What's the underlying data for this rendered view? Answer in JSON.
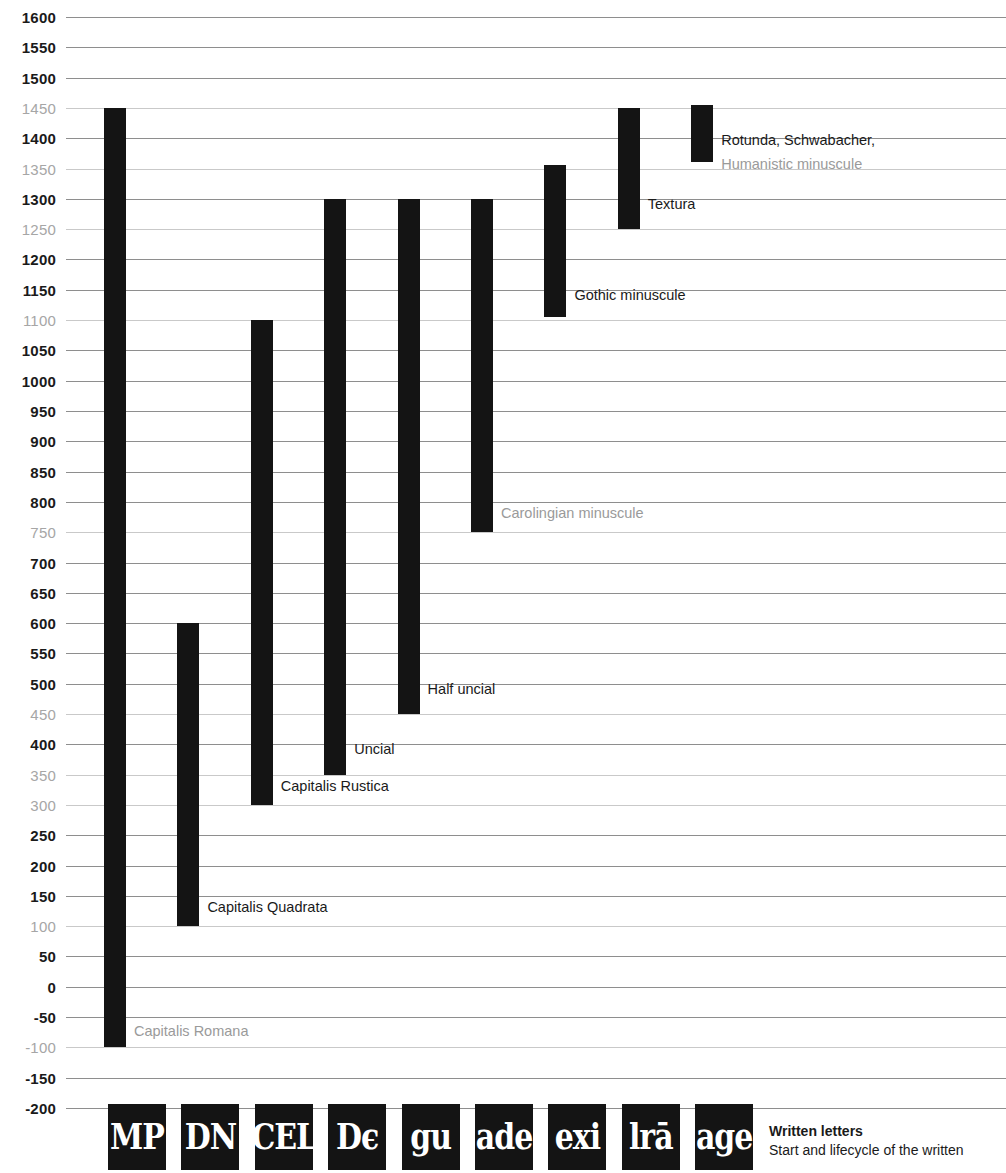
{
  "chart_data": {
    "type": "bar",
    "orientation": "vertical-range",
    "title": "Written letters",
    "subtitle": "Start and lifecycle of the written",
    "xlabel": "",
    "ylabel": "",
    "ylim": [
      -200,
      1600
    ],
    "tick_step": 50,
    "grid": true,
    "legend": "none",
    "y_ticks": [
      {
        "value": 1600,
        "label": "1600",
        "muted": false
      },
      {
        "value": 1550,
        "label": "1550",
        "muted": false
      },
      {
        "value": 1500,
        "label": "1500",
        "muted": false
      },
      {
        "value": 1450,
        "label": "1450",
        "muted": true
      },
      {
        "value": 1400,
        "label": "1400",
        "muted": false
      },
      {
        "value": 1350,
        "label": "1350",
        "muted": true
      },
      {
        "value": 1300,
        "label": "1300",
        "muted": false
      },
      {
        "value": 1250,
        "label": "1250",
        "muted": true
      },
      {
        "value": 1200,
        "label": "1200",
        "muted": false
      },
      {
        "value": 1150,
        "label": "1150",
        "muted": false
      },
      {
        "value": 1100,
        "label": "1100",
        "muted": true
      },
      {
        "value": 1050,
        "label": "1050",
        "muted": false
      },
      {
        "value": 1000,
        "label": "1000",
        "muted": false
      },
      {
        "value": 950,
        "label": "950",
        "muted": false
      },
      {
        "value": 900,
        "label": "900",
        "muted": false
      },
      {
        "value": 850,
        "label": "850",
        "muted": false
      },
      {
        "value": 800,
        "label": "800",
        "muted": false
      },
      {
        "value": 750,
        "label": "750",
        "muted": true
      },
      {
        "value": 700,
        "label": "700",
        "muted": false
      },
      {
        "value": 650,
        "label": "650",
        "muted": false
      },
      {
        "value": 600,
        "label": "600",
        "muted": false
      },
      {
        "value": 550,
        "label": "550",
        "muted": false
      },
      {
        "value": 500,
        "label": "500",
        "muted": false
      },
      {
        "value": 450,
        "label": "450",
        "muted": true
      },
      {
        "value": 400,
        "label": "400",
        "muted": false
      },
      {
        "value": 350,
        "label": "350",
        "muted": true
      },
      {
        "value": 300,
        "label": "300",
        "muted": true
      },
      {
        "value": 250,
        "label": "250",
        "muted": false
      },
      {
        "value": 200,
        "label": "200",
        "muted": false
      },
      {
        "value": 150,
        "label": "150",
        "muted": false
      },
      {
        "value": 100,
        "label": "100",
        "muted": true
      },
      {
        "value": 50,
        "label": "50",
        "muted": false
      },
      {
        "value": 0,
        "label": "0",
        "muted": false
      },
      {
        "value": -50,
        "label": "-50",
        "muted": false
      },
      {
        "value": -100,
        "label": "-100",
        "muted": true
      },
      {
        "value": -150,
        "label": "-150",
        "muted": false
      },
      {
        "value": -200,
        "label": "-200",
        "muted": false
      }
    ],
    "categories": [
      "Capitalis Romana",
      "Capitalis Quadrata",
      "Capitalis Rustica",
      "Uncial",
      "Half uncial",
      "Carolingian minuscule",
      "Gothic minuscule",
      "Textura",
      "Rotunda, Schwabacher, Humanistic minuscule"
    ],
    "bars": [
      {
        "label": "Capitalis Romana",
        "start": -100,
        "end": 1450,
        "label_muted": true,
        "label_at": -75
      },
      {
        "label": "Capitalis Quadrata",
        "start": 100,
        "end": 600,
        "label_muted": false,
        "label_at": 130
      },
      {
        "label": "Capitalis Rustica",
        "start": 300,
        "end": 1100,
        "label_muted": false,
        "label_at": 330
      },
      {
        "label": "Uncial",
        "start": 350,
        "end": 1300,
        "label_muted": false,
        "label_at": 390
      },
      {
        "label": "Half uncial",
        "start": 450,
        "end": 1300,
        "label_muted": false,
        "label_at": 490
      },
      {
        "label": "Carolingian minuscule",
        "start": 750,
        "end": 1300,
        "label_muted": true,
        "label_at": 780
      },
      {
        "label": "Gothic minuscule",
        "start": 1105,
        "end": 1355,
        "label_muted": false,
        "label_at": 1140
      },
      {
        "label": "Textura",
        "start": 1250,
        "end": 1450,
        "label_muted": false,
        "label_at": 1290
      },
      {
        "label": "Rotunda, Schwabacher,",
        "start": 1360,
        "end": 1455,
        "label_muted": false,
        "label_at": 1395
      },
      {
        "label": "Humanistic minuscule",
        "start": null,
        "end": null,
        "label_muted": true,
        "label_at": 1355
      }
    ]
  },
  "specimens": [
    {
      "name": "capitalis-romana-specimen",
      "glyphs": "MP"
    },
    {
      "name": "capitalis-quadrata-specimen",
      "glyphs": "DN"
    },
    {
      "name": "capitalis-rustica-specimen",
      "glyphs": "CEL"
    },
    {
      "name": "uncial-specimen",
      "glyphs": "Dϵ"
    },
    {
      "name": "half-uncial-specimen",
      "glyphs": "gu"
    },
    {
      "name": "carolingian-specimen",
      "glyphs": "ade"
    },
    {
      "name": "gothic-minuscule-specimen",
      "glyphs": "exi"
    },
    {
      "name": "textura-specimen",
      "glyphs": "lrā"
    },
    {
      "name": "rotunda-specimen",
      "glyphs": "age"
    }
  ],
  "caption": {
    "title": "Written letters",
    "subtitle": "Start and lifecycle of the written"
  },
  "colors": {
    "bar": "#141414",
    "gridline_major": "#8e8e8e",
    "gridline_minor": "#c9c9c9",
    "text": "#1a1a1a",
    "text_muted": "#9a9a9a",
    "background": "#ffffff"
  }
}
